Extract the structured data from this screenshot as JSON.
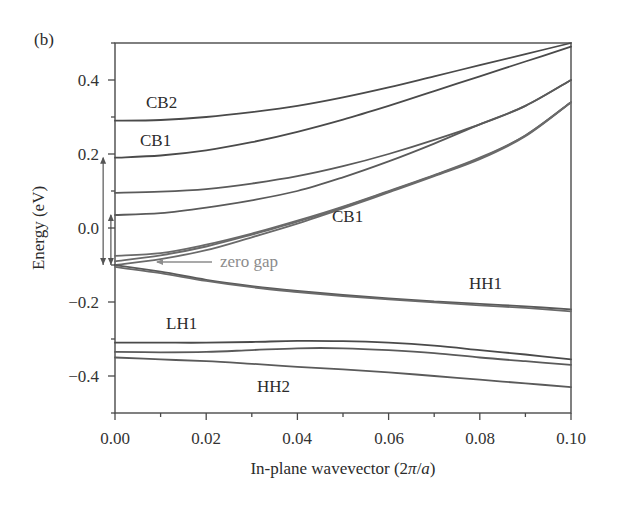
{
  "panel_label": "(b)",
  "chart_data": {
    "type": "line",
    "title": "",
    "xlabel": "In-plane wavevector (2π/a)",
    "xlabel_parts": [
      "In-plane wavevector (2",
      "π",
      "/",
      "a",
      ")"
    ],
    "ylabel": "Energy (eV)",
    "xlim": [
      0.0,
      0.1
    ],
    "ylim": [
      -0.5,
      0.5
    ],
    "grid": false,
    "legend": "none",
    "x_ticks": [
      "0.00",
      "0.02",
      "0.04",
      "0.06",
      "0.08",
      "0.10"
    ],
    "x_tick_values": [
      0.0,
      0.02,
      0.04,
      0.06,
      0.08,
      0.1
    ],
    "y_ticks": [
      "0.4",
      "0.2",
      "0.0",
      "−0.2",
      "−0.4"
    ],
    "y_tick_values": [
      0.4,
      0.2,
      0.0,
      -0.2,
      -0.4
    ],
    "x": [
      0.0,
      0.01,
      0.02,
      0.03,
      0.04,
      0.05,
      0.06,
      0.07,
      0.08,
      0.09,
      0.1
    ],
    "series": [
      {
        "name": "CB2",
        "color": "#4a4a4a",
        "values": [
          0.29,
          0.292,
          0.3,
          0.313,
          0.33,
          0.353,
          0.38,
          0.41,
          0.44,
          0.47,
          0.5
        ]
      },
      {
        "name": "CB1",
        "color": "#4a4a4a",
        "values": [
          0.19,
          0.196,
          0.21,
          0.232,
          0.26,
          0.293,
          0.33,
          0.37,
          0.41,
          0.45,
          0.49
        ]
      },
      {
        "name": "band-3",
        "color": "#5a5a5a",
        "values": [
          0.095,
          0.098,
          0.105,
          0.12,
          0.14,
          0.167,
          0.2,
          0.238,
          0.28,
          0.33,
          0.4
        ]
      },
      {
        "name": "band-4",
        "color": "#5a5a5a",
        "values": [
          0.035,
          0.04,
          0.055,
          0.075,
          0.1,
          0.137,
          0.18,
          0.228,
          0.28,
          0.33,
          0.4
        ]
      },
      {
        "name": "CB1-lower-a",
        "color": "#6a6a6a",
        "values": [
          -0.075,
          -0.068,
          -0.045,
          -0.015,
          0.02,
          0.058,
          0.1,
          0.143,
          0.19,
          0.25,
          0.34
        ]
      },
      {
        "name": "CB1-lower-b",
        "color": "#6a6a6a",
        "values": [
          -0.09,
          -0.074,
          -0.05,
          -0.018,
          0.017,
          0.056,
          0.098,
          0.142,
          0.188,
          0.25,
          0.34
        ]
      },
      {
        "name": "zero-gap-branch",
        "color": "#6a6a6a",
        "values": [
          -0.1,
          -0.084,
          -0.06,
          -0.025,
          0.012,
          0.053,
          0.096,
          0.14,
          0.186,
          0.248,
          0.34
        ]
      },
      {
        "name": "HH1",
        "color": "#5a5a5a",
        "values": [
          -0.1,
          -0.118,
          -0.14,
          -0.157,
          -0.17,
          -0.181,
          -0.19,
          -0.198,
          -0.205,
          -0.212,
          -0.22
        ]
      },
      {
        "name": "HH1-b",
        "color": "#6a6a6a",
        "values": [
          -0.105,
          -0.122,
          -0.143,
          -0.16,
          -0.173,
          -0.184,
          -0.193,
          -0.201,
          -0.209,
          -0.216,
          -0.225
        ]
      },
      {
        "name": "LH1",
        "color": "#4a4a4a",
        "values": [
          -0.31,
          -0.31,
          -0.31,
          -0.308,
          -0.305,
          -0.306,
          -0.31,
          -0.318,
          -0.33,
          -0.342,
          -0.355
        ]
      },
      {
        "name": "band-LH-2",
        "color": "#5a5a5a",
        "values": [
          -0.335,
          -0.336,
          -0.335,
          -0.33,
          -0.325,
          -0.325,
          -0.33,
          -0.338,
          -0.35,
          -0.36,
          -0.37
        ]
      },
      {
        "name": "HH2",
        "color": "#5a5a5a",
        "values": [
          -0.35,
          -0.355,
          -0.36,
          -0.367,
          -0.375,
          -0.382,
          -0.39,
          -0.4,
          -0.41,
          -0.42,
          -0.43
        ]
      }
    ],
    "annotations": [
      {
        "text": "CB2",
        "x": 0.0065,
        "y": 0.33
      },
      {
        "text": "CB1",
        "x": 0.006,
        "y": 0.225
      },
      {
        "text": "CB1",
        "x": 0.0455,
        "y": -0.02
      },
      {
        "text": "HH1",
        "x": 0.0765,
        "y": -0.155
      },
      {
        "text": "LH1",
        "x": 0.0065,
        "y": -0.263
      },
      {
        "text": "HH2",
        "x": 0.0405,
        "y": -0.415
      },
      {
        "text": "zero gap",
        "x": 0.0167,
        "y": -0.085,
        "arrow_to": [
          0.0035,
          -0.085
        ]
      }
    ],
    "vertical_arrows": [
      {
        "x": -0.0026,
        "from": -0.1,
        "to": 0.19,
        "direction": "up-down"
      },
      {
        "x": -0.0009,
        "from": -0.1,
        "to": 0.035,
        "direction": "up-down"
      }
    ]
  }
}
